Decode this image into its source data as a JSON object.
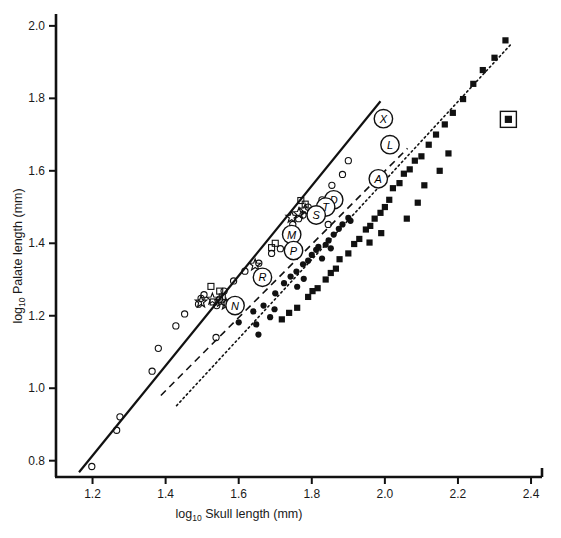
{
  "figure": {
    "background": "#ffffff",
    "ink": "#111111"
  },
  "axes": {
    "x": {
      "title_main": "Skull length (mm)",
      "title_prefix": "log",
      "title_sub": "10",
      "ticks": [
        "1.2",
        "1.4",
        "1.6",
        "1.8",
        "2.0",
        "2.2",
        "2.4"
      ],
      "tick_values": [
        1.2,
        1.4,
        1.6,
        1.8,
        2.0,
        2.2,
        2.4
      ],
      "range": [
        1.1,
        2.43
      ]
    },
    "y": {
      "title_main": "Palate length (mm)",
      "title_prefix": "log",
      "title_sub": "10",
      "ticks": [
        "0.8",
        "1.0",
        "1.2",
        "1.4",
        "1.6",
        "1.8",
        "2.0"
      ],
      "tick_values": [
        0.8,
        1.0,
        1.2,
        1.4,
        1.6,
        1.8,
        2.0
      ],
      "range": [
        0.755,
        2.03
      ]
    }
  },
  "chart_data": {
    "type": "scatter",
    "title": "",
    "xlabel": "log10 Skull length (mm)",
    "ylabel": "log10 Palate length (mm)",
    "xlim": [
      1.1,
      2.43
    ],
    "ylim": [
      0.755,
      2.03
    ],
    "grid": false,
    "legend": "none",
    "series": [
      {
        "name": "open-circle",
        "marker": "open-circle",
        "points": [
          [
            1.198,
            0.784
          ],
          [
            1.275,
            0.921
          ],
          [
            1.266,
            0.884
          ],
          [
            1.363,
            1.047
          ],
          [
            1.38,
            1.11
          ],
          [
            1.428,
            1.172
          ],
          [
            1.452,
            1.205
          ],
          [
            1.49,
            1.232
          ],
          [
            1.497,
            1.248
          ],
          [
            1.505,
            1.258
          ],
          [
            1.54,
            1.228
          ],
          [
            1.548,
            1.246
          ],
          [
            1.56,
            1.268
          ],
          [
            1.586,
            1.296
          ],
          [
            1.617,
            1.323
          ],
          [
            1.655,
            1.345
          ],
          [
            1.69,
            1.372
          ],
          [
            1.714,
            1.385
          ],
          [
            1.742,
            1.43
          ],
          [
            1.748,
            1.452
          ],
          [
            1.764,
            1.468
          ],
          [
            1.776,
            1.478
          ],
          [
            1.79,
            1.5
          ],
          [
            1.828,
            1.52
          ],
          [
            1.855,
            1.56
          ],
          [
            1.884,
            1.59
          ],
          [
            1.9,
            1.628
          ],
          [
            1.845,
            1.452
          ],
          [
            1.538,
            1.14
          ]
        ]
      },
      {
        "name": "open-square",
        "marker": "open-square",
        "points": [
          [
            1.524,
            1.281
          ],
          [
            1.548,
            1.268
          ],
          [
            1.555,
            1.252
          ],
          [
            1.53,
            1.238
          ],
          [
            1.77,
            1.518
          ],
          [
            1.782,
            1.508
          ],
          [
            1.7,
            1.4
          ],
          [
            1.69,
            1.388
          ]
        ]
      },
      {
        "name": "open-star",
        "marker": "open-star",
        "points": [
          [
            1.497,
            1.238
          ],
          [
            1.528,
            1.246
          ],
          [
            1.552,
            1.24
          ],
          [
            1.565,
            1.232
          ],
          [
            1.645,
            1.34
          ],
          [
            1.745,
            1.472
          ],
          [
            1.765,
            1.482
          ],
          [
            1.782,
            1.492
          ]
        ]
      },
      {
        "name": "filled-circle",
        "marker": "filled-circle",
        "points": [
          [
            1.6,
            1.182
          ],
          [
            1.64,
            1.212
          ],
          [
            1.648,
            1.176
          ],
          [
            1.668,
            1.228
          ],
          [
            1.7,
            1.262
          ],
          [
            1.724,
            1.29
          ],
          [
            1.742,
            1.308
          ],
          [
            1.758,
            1.322
          ],
          [
            1.776,
            1.342
          ],
          [
            1.79,
            1.352
          ],
          [
            1.8,
            1.368
          ],
          [
            1.812,
            1.382
          ],
          [
            1.818,
            1.39
          ],
          [
            1.838,
            1.396
          ],
          [
            1.846,
            1.408
          ],
          [
            1.86,
            1.424
          ],
          [
            1.874,
            1.44
          ],
          [
            1.884,
            1.452
          ],
          [
            1.9,
            1.47
          ],
          [
            1.906,
            1.462
          ],
          [
            1.778,
            1.302
          ],
          [
            1.76,
            1.28
          ],
          [
            1.828,
            1.358
          ],
          [
            1.852,
            1.386
          ],
          [
            1.698,
            1.218
          ],
          [
            1.686,
            1.196
          ],
          [
            1.654,
            1.148
          ]
        ]
      },
      {
        "name": "filled-square",
        "marker": "filled-square",
        "points": [
          [
            1.718,
            1.19
          ],
          [
            1.738,
            1.208
          ],
          [
            1.76,
            1.222
          ],
          [
            1.79,
            1.252
          ],
          [
            1.802,
            1.268
          ],
          [
            1.816,
            1.276
          ],
          [
            1.838,
            1.3
          ],
          [
            1.852,
            1.318
          ],
          [
            1.866,
            1.33
          ],
          [
            1.876,
            1.356
          ],
          [
            1.9,
            1.372
          ],
          [
            1.916,
            1.398
          ],
          [
            1.93,
            1.412
          ],
          [
            1.948,
            1.438
          ],
          [
            1.96,
            1.448
          ],
          [
            1.972,
            1.468
          ],
          [
            1.988,
            1.484
          ],
          [
            2.0,
            1.5
          ],
          [
            2.012,
            1.52
          ],
          [
            2.022,
            1.552
          ],
          [
            2.04,
            1.566
          ],
          [
            2.052,
            1.592
          ],
          [
            2.068,
            1.604
          ],
          [
            2.082,
            1.628
          ],
          [
            2.1,
            1.64
          ],
          [
            2.12,
            1.672
          ],
          [
            2.14,
            1.7
          ],
          [
            2.164,
            1.728
          ],
          [
            2.186,
            1.76
          ],
          [
            2.214,
            1.798
          ],
          [
            2.242,
            1.84
          ],
          [
            2.268,
            1.878
          ],
          [
            2.3,
            1.912
          ],
          [
            2.33,
            1.96
          ],
          [
            2.15,
            1.6
          ],
          [
            2.06,
            1.468
          ],
          [
            2.09,
            1.512
          ],
          [
            1.99,
            1.428
          ],
          [
            1.958,
            1.402
          ],
          [
            2.108,
            1.56
          ],
          [
            2.174,
            1.648
          ]
        ]
      },
      {
        "name": "boxed-square-outlier",
        "marker": "boxed-square",
        "points": [
          [
            2.338,
            1.742
          ]
        ]
      }
    ],
    "fit_lines": [
      {
        "name": "solid-fit-line",
        "style": "solid",
        "x0": 1.163,
        "y0": 0.768,
        "x1": 1.988,
        "y1": 1.792
      },
      {
        "name": "dashed-fit-line",
        "style": "dashed",
        "x0": 1.387,
        "y0": 0.98,
        "x1": 2.062,
        "y1": 1.662
      },
      {
        "name": "dotted-fit-line",
        "style": "dotted",
        "x0": 1.43,
        "y0": 0.952,
        "x1": 2.344,
        "y1": 1.948
      }
    ],
    "group_labels": [
      {
        "letter": "X",
        "x": 1.996,
        "y": 1.744
      },
      {
        "letter": "L",
        "x": 2.014,
        "y": 1.672
      },
      {
        "letter": "A",
        "x": 1.982,
        "y": 1.578
      },
      {
        "letter": "D",
        "x": 1.86,
        "y": 1.52
      },
      {
        "letter": "T",
        "x": 1.838,
        "y": 1.5
      },
      {
        "letter": "S",
        "x": 1.812,
        "y": 1.478
      },
      {
        "letter": "M",
        "x": 1.745,
        "y": 1.424
      },
      {
        "letter": "P",
        "x": 1.75,
        "y": 1.38
      },
      {
        "letter": "R",
        "x": 1.665,
        "y": 1.306
      },
      {
        "letter": "N",
        "x": 1.59,
        "y": 1.228
      }
    ]
  }
}
